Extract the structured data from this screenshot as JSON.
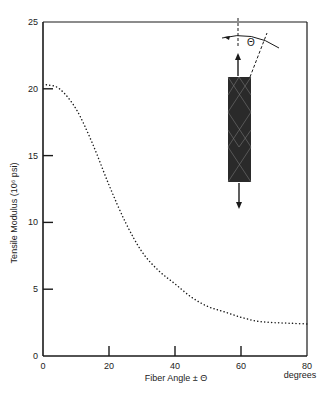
{
  "chart_data": {
    "type": "line",
    "title": "",
    "xlabel": "Fiber Angle ± Θ",
    "xunit_label": "degrees",
    "ylabel": "Tensile Modulus (10⁶ psi)",
    "xlim": [
      0,
      80
    ],
    "ylim": [
      0,
      25
    ],
    "xticks": [
      0,
      20,
      40,
      60,
      80
    ],
    "yticks": [
      0,
      5,
      10,
      15,
      20,
      25
    ],
    "grid": false,
    "legend": null,
    "line_style": "dotted",
    "series": [
      {
        "name": "Tensile Modulus",
        "x": [
          1,
          5,
          10,
          15,
          20,
          25,
          30,
          35,
          40,
          45,
          50,
          55,
          60,
          65,
          70,
          75,
          80
        ],
        "y": [
          20.3,
          20.0,
          18.5,
          15.9,
          12.8,
          10.0,
          7.8,
          6.4,
          5.4,
          4.4,
          3.7,
          3.3,
          2.9,
          2.6,
          2.5,
          2.45,
          2.4
        ]
      }
    ],
    "annotations": [
      {
        "type": "inset-diagram",
        "description": "Fiber composite specimen with tensile load arrows and fiber angle Θ",
        "symbol": "Θ"
      }
    ]
  },
  "labels": {
    "y_title": "Tensile Modulus (10⁶ psi)",
    "x_title": "Fiber Angle ± Θ",
    "x_unit": "degrees",
    "theta": "Θ",
    "xticks": [
      "0",
      "20",
      "40",
      "60",
      "80"
    ],
    "yticks": [
      "0",
      "5",
      "10",
      "15",
      "20",
      "25"
    ]
  },
  "colors": {
    "ink": "#1a1a1a",
    "background": "#ffffff",
    "specimen": "#2a2a2a"
  }
}
